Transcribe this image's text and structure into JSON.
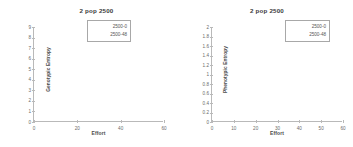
{
  "figure": {
    "background": "#ffffff",
    "panels": [
      {
        "title": "2 pop 2500",
        "xlabel": "Effort",
        "ylabel": "Genotypic Entropy",
        "legend": {
          "entries": [
            {
              "label": "2500-0",
              "color": "#4472c4"
            },
            {
              "label": "2500-48",
              "color": "#c00000"
            }
          ]
        }
      },
      {
        "title": "2 pop 2500",
        "xlabel": "Effort",
        "ylabel": "Phenotypic Entropy",
        "legend": {
          "entries": [
            {
              "label": "2500-0",
              "color": "#4472c4"
            },
            {
              "label": "2500-48",
              "color": "#c00000"
            }
          ]
        }
      }
    ]
  },
  "chart_data": [
    {
      "type": "line",
      "title": "2 pop 2500",
      "xlabel": "Effort",
      "ylabel": "Genotypic Entropy",
      "xlim": [
        0,
        60
      ],
      "ylim": [
        0,
        9
      ],
      "xticks": [
        0,
        20,
        40,
        60
      ],
      "xtick_labels": [
        "0",
        "20",
        "40",
        "60"
      ],
      "yticks": [
        0,
        1,
        2,
        3,
        4,
        5,
        6,
        7,
        8,
        9
      ],
      "ytick_labels": [
        "0",
        "1",
        "2",
        "3",
        "4",
        "5",
        "6",
        "7",
        "8",
        "9"
      ],
      "grid": false,
      "legend_position": "upper right",
      "series": [
        {
          "name": "2500-0",
          "color": "#4472c4",
          "x": [],
          "values": []
        },
        {
          "name": "2500-48",
          "color": "#c00000",
          "x": [],
          "values": []
        }
      ],
      "note": "Plot area is empty — no data curves rendered."
    },
    {
      "type": "line",
      "title": "2 pop 2500",
      "xlabel": "Effort",
      "ylabel": "Phenotypic Entropy",
      "xlim": [
        0,
        60
      ],
      "ylim": [
        0,
        2
      ],
      "xticks": [
        0,
        10,
        20,
        30,
        40,
        50,
        60
      ],
      "xtick_labels": [
        "0",
        "10",
        "20",
        "30",
        "40",
        "50",
        "60"
      ],
      "yticks": [
        0,
        0.2,
        0.4,
        0.6,
        0.8,
        1,
        1.2,
        1.4,
        1.6,
        1.8,
        2
      ],
      "ytick_labels": [
        "0",
        "0.2",
        "0.4",
        "0.6",
        "0.8",
        "1",
        "1.2",
        "1.4",
        "1.6",
        "1.8",
        "2"
      ],
      "grid": false,
      "legend_position": "upper right",
      "series": [
        {
          "name": "2500-0",
          "color": "#4472c4",
          "x": [],
          "values": []
        },
        {
          "name": "2500-48",
          "color": "#c00000",
          "x": [],
          "values": []
        }
      ],
      "note": "Plot area is empty — no data curves rendered."
    }
  ]
}
